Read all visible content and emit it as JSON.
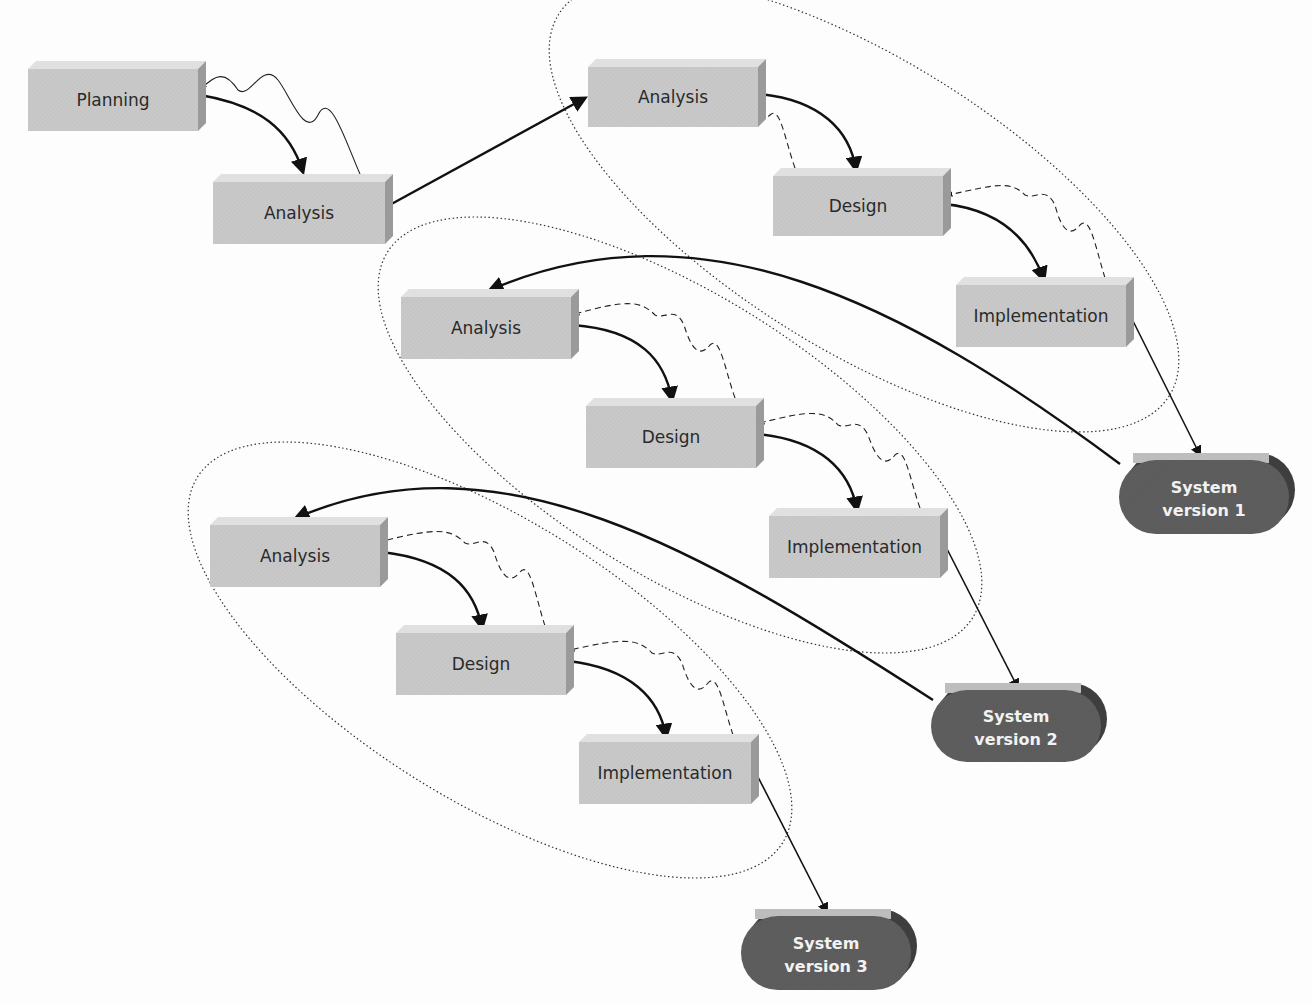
{
  "diagram": {
    "type": "iterative system development (phased) diagram",
    "colors": {
      "box_face": "#c9c9c9",
      "box_top": "#e0e0e0",
      "box_side": "#9a9a9a",
      "system_face": "#5e5e5e",
      "system_top": "#bdbdbd",
      "system_side": "#3e3e3e",
      "system_text": "#f2f2f2",
      "arrow": "#111111"
    },
    "boxes": [
      {
        "id": "planning",
        "label": "Planning",
        "x": 28,
        "y": 69,
        "w": 170,
        "h": 62
      },
      {
        "id": "analysis-0",
        "label": "Analysis",
        "x": 213,
        "y": 182,
        "w": 172,
        "h": 62
      },
      {
        "id": "analysis-1",
        "label": "Analysis",
        "x": 588,
        "y": 67,
        "w": 170,
        "h": 60
      },
      {
        "id": "design-1",
        "label": "Design",
        "x": 773,
        "y": 176,
        "w": 170,
        "h": 60
      },
      {
        "id": "implementation-1",
        "label": "Implementation",
        "x": 956,
        "y": 285,
        "w": 170,
        "h": 62
      },
      {
        "id": "analysis-2",
        "label": "Analysis",
        "x": 401,
        "y": 297,
        "w": 170,
        "h": 62
      },
      {
        "id": "design-2",
        "label": "Design",
        "x": 586,
        "y": 406,
        "w": 170,
        "h": 62
      },
      {
        "id": "implementation-2",
        "label": "Implementation",
        "x": 769,
        "y": 516,
        "w": 171,
        "h": 62
      },
      {
        "id": "analysis-3",
        "label": "Analysis",
        "x": 210,
        "y": 525,
        "w": 170,
        "h": 62
      },
      {
        "id": "design-3",
        "label": "Design",
        "x": 396,
        "y": 633,
        "w": 170,
        "h": 62
      },
      {
        "id": "implementation-3",
        "label": "Implementation",
        "x": 579,
        "y": 742,
        "w": 172,
        "h": 62
      }
    ],
    "systems": [
      {
        "id": "system-version-1",
        "line1": "System",
        "line2": "version 1",
        "x": 1119,
        "y": 460,
        "w": 170,
        "h": 74
      },
      {
        "id": "system-version-2",
        "line1": "System",
        "line2": "version 2",
        "x": 931,
        "y": 690,
        "w": 170,
        "h": 72
      },
      {
        "id": "system-version-3",
        "line1": "System",
        "line2": "version 3",
        "x": 741,
        "y": 916,
        "w": 170,
        "h": 74
      }
    ],
    "groups": [
      {
        "id": "version-1-cycle",
        "cx": 864,
        "cy": 205,
        "rx": 360,
        "ry": 145,
        "rotate": 32
      },
      {
        "id": "version-2-cycle",
        "cx": 680,
        "cy": 435,
        "rx": 345,
        "ry": 140,
        "rotate": 32
      },
      {
        "id": "version-3-cycle",
        "cx": 490,
        "cy": 660,
        "rx": 345,
        "ry": 140,
        "rotate": 32
      }
    ]
  }
}
